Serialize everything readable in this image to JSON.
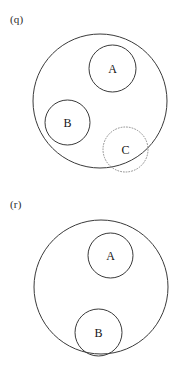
{
  "figure": {
    "background_color": "#ffffff",
    "stroke_color": "#3a3a3a",
    "text_color": "#141414"
  },
  "panels": [
    {
      "id": "q",
      "label": "(q)",
      "outer": {
        "name": "outer-universe-circle",
        "cx": 100,
        "cy": 101,
        "r": 67,
        "style": "solid"
      },
      "sets": [
        {
          "id": "A",
          "label": "A",
          "cx": 112.5,
          "cy": 68.5,
          "r": 23.5,
          "style": "solid"
        },
        {
          "id": "B",
          "label": "B",
          "cx": 67.5,
          "cy": 122.5,
          "r": 22.5,
          "style": "solid"
        },
        {
          "id": "C",
          "label": "C",
          "cx": 125.5,
          "cy": 149.5,
          "r": 22.5,
          "style": "dotted"
        }
      ]
    },
    {
      "id": "r",
      "label": "(r)",
      "outer": {
        "name": "outer-universe-circle",
        "cx": 101,
        "cy": 96,
        "r": 67,
        "style": "solid"
      },
      "sets": [
        {
          "id": "A",
          "label": "A",
          "cx": 110.5,
          "cy": 64.5,
          "r": 22.5,
          "style": "solid"
        },
        {
          "id": "B",
          "label": "B",
          "cx": 98.5,
          "cy": 141.5,
          "r": 23.5,
          "style": "solid"
        }
      ]
    }
  ]
}
